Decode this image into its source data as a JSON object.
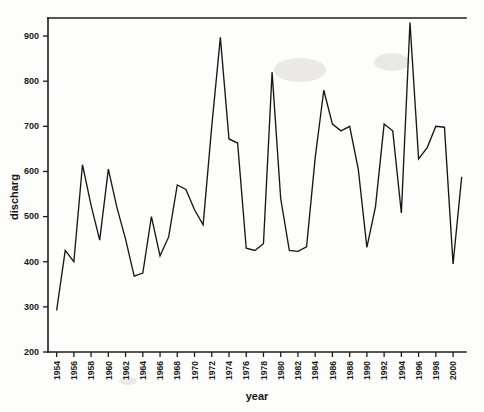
{
  "chart_data": {
    "type": "line",
    "title": "",
    "xlabel": "year",
    "ylabel": "discharg",
    "xlim": [
      1953,
      2001.5
    ],
    "ylim": [
      200,
      940
    ],
    "grid": false,
    "legend": false,
    "x_tick_labels": [
      "1954",
      "1956",
      "1958",
      "1960",
      "1962",
      "1964",
      "1966",
      "1968",
      "1970",
      "1972",
      "1974",
      "1976",
      "1978",
      "1980",
      "1982",
      "1984",
      "1986",
      "1988",
      "1990",
      "1992",
      "1994",
      "1996",
      "1998",
      "2000"
    ],
    "x_tick_values": [
      1954,
      1956,
      1958,
      1960,
      1962,
      1964,
      1966,
      1968,
      1970,
      1972,
      1974,
      1976,
      1978,
      1980,
      1982,
      1984,
      1986,
      1988,
      1990,
      1992,
      1994,
      1996,
      1998,
      2000
    ],
    "y_tick_labels": [
      "200",
      "300",
      "400",
      "500",
      "600",
      "700",
      "800",
      "900"
    ],
    "y_tick_values": [
      200,
      300,
      400,
      500,
      600,
      700,
      800,
      900
    ],
    "x": [
      1954,
      1955,
      1956,
      1957,
      1958,
      1959,
      1960,
      1961,
      1962,
      1963,
      1964,
      1965,
      1966,
      1967,
      1968,
      1969,
      1970,
      1971,
      1972,
      1973,
      1974,
      1975,
      1976,
      1977,
      1978,
      1979,
      1980,
      1981,
      1982,
      1983,
      1984,
      1985,
      1986,
      1987,
      1988,
      1989,
      1990,
      1991,
      1992,
      1993,
      1994,
      1995,
      1996,
      1997,
      1998,
      1999,
      2000,
      2001
    ],
    "values": [
      292,
      425,
      400,
      615,
      525,
      448,
      605,
      520,
      450,
      368,
      375,
      500,
      413,
      455,
      570,
      560,
      515,
      482,
      700,
      897,
      672,
      663,
      430,
      425,
      440,
      820,
      540,
      425,
      423,
      433,
      630,
      780,
      705,
      690,
      700,
      605,
      432,
      522,
      705,
      690,
      508,
      930,
      628,
      653,
      700,
      698,
      395,
      588
    ],
    "series": [
      {
        "name": "discharg",
        "values": [
          292,
          425,
          400,
          615,
          525,
          448,
          605,
          520,
          450,
          368,
          375,
          500,
          413,
          455,
          570,
          560,
          515,
          482,
          700,
          897,
          672,
          663,
          430,
          425,
          440,
          820,
          540,
          425,
          423,
          433,
          630,
          780,
          705,
          690,
          700,
          605,
          432,
          522,
          705,
          690,
          508,
          930,
          628,
          653,
          700,
          698,
          395,
          588
        ]
      }
    ]
  },
  "axes": {
    "y_title": "discharg",
    "x_title": "year"
  },
  "colors": {
    "line": "#17171a",
    "axis": "#1c1c1c",
    "background": "#fdfdfc"
  }
}
